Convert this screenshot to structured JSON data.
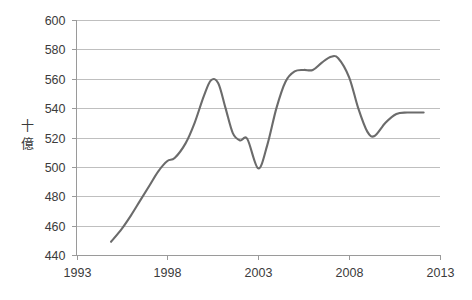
{
  "chart_data": {
    "type": "line",
    "title": "",
    "xlabel": "",
    "ylabel": "十億",
    "ylabel_chars": [
      "十",
      "億"
    ],
    "xlim": [
      1993,
      2013
    ],
    "ylim": [
      440,
      600
    ],
    "ytick_step": 20,
    "xtick_step": 5,
    "grid": true,
    "legend": false,
    "line_color": "#6b6b6b",
    "gridline_color": "#bfbfbf",
    "axis_color": "#9a9a9a",
    "background_color": "#ffffff",
    "x_ticks": [
      1993,
      1998,
      2003,
      2008,
      2013
    ],
    "x_tick_labels": [
      "1993",
      "1998",
      "2003",
      "2008",
      "2013"
    ],
    "y_ticks": [
      440,
      460,
      480,
      500,
      520,
      540,
      560,
      580,
      600
    ],
    "y_tick_labels": [
      "440",
      "460",
      "480",
      "500",
      "520",
      "540",
      "560",
      "580",
      "600"
    ],
    "series": [
      {
        "name": "",
        "x": [
          1994.9,
          1995.5,
          1996.0,
          1996.5,
          1997.0,
          1997.5,
          1998.0,
          1998.4,
          1999.0,
          1999.5,
          2000.0,
          2000.4,
          2000.8,
          2001.2,
          2001.6,
          2002.0,
          2002.4,
          2003.0,
          2003.5,
          2004.0,
          2004.5,
          2005.0,
          2005.5,
          2006.0,
          2006.5,
          2007.0,
          2007.4,
          2008.0,
          2008.5,
          2009.0,
          2009.4,
          2010.0,
          2010.6,
          2011.2,
          2012.1
        ],
        "values": [
          449,
          458,
          467,
          477,
          487,
          497,
          504,
          506,
          516,
          530,
          548,
          559,
          557,
          540,
          523,
          518,
          519,
          499,
          515,
          540,
          558,
          565,
          566,
          566,
          571,
          575,
          574,
          561,
          540,
          524,
          521,
          530,
          536,
          537,
          537
        ]
      }
    ]
  }
}
